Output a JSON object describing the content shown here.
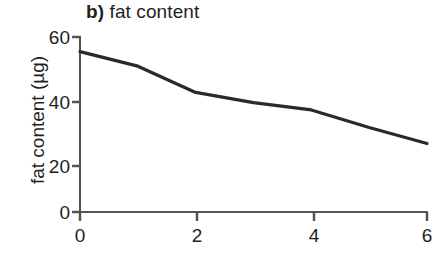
{
  "chart_data": {
    "type": "line",
    "panel_letter": "b)",
    "title_text": "fat content",
    "xlabel": "",
    "ylabel": "fat content (µg)",
    "x": [
      0,
      1,
      2,
      3,
      4,
      5,
      6
    ],
    "values": [
      55,
      50,
      41,
      37.5,
      35,
      29,
      23.5
    ],
    "series": [
      {
        "name": "fat content",
        "values": [
          55,
          50,
          41,
          37.5,
          35,
          29,
          23.5
        ],
        "color": "#2a2a2a"
      }
    ],
    "xlim": [
      0,
      6
    ],
    "ylim": [
      0,
      60
    ],
    "xticks": [
      "0",
      "2",
      "4",
      "6"
    ],
    "xtick_values": [
      0,
      2,
      4,
      6
    ],
    "yticks": [
      "0",
      "20",
      "40",
      "60"
    ],
    "ytick_values": [
      0,
      20,
      40,
      60
    ],
    "grid": false,
    "legend": false,
    "legend_position": "none"
  },
  "axes": {
    "y_axis_label": "fat content (µg)",
    "x_axis_label": ""
  },
  "colors": {
    "line": "#2a2a2a",
    "axis": "#545454",
    "background": "#ffffff",
    "text": "#1f1f1f"
  }
}
